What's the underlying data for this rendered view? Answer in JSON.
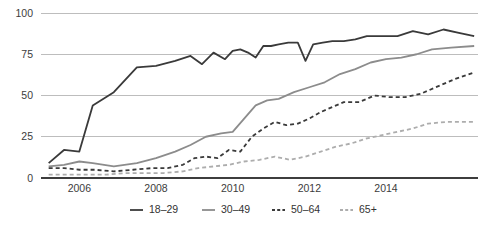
{
  "chart_data": {
    "type": "line",
    "title": "",
    "subtitle": "",
    "xlabel": "",
    "ylabel": "",
    "xlim": [
      2005.0,
      2016.4
    ],
    "ylim": [
      0,
      100
    ],
    "xticks": [
      2006,
      2008,
      2010,
      2012,
      2014
    ],
    "xtick_labels": [
      "2006",
      "2008",
      "2010",
      "2012",
      "2014"
    ],
    "yticks": [
      0,
      25,
      50,
      75,
      100
    ],
    "ytick_labels": [
      "0",
      "25",
      "50",
      "75",
      "100"
    ],
    "grid": "horizontal",
    "legend_position": "bottom",
    "series": [
      {
        "name": "18–29",
        "color": "#3a3a3a",
        "style": "solid",
        "width": 1.8,
        "x": [
          2005.2,
          2005.6,
          2006.0,
          2006.35,
          2006.9,
          2007.5,
          2008.0,
          2008.5,
          2008.9,
          2009.2,
          2009.5,
          2009.8,
          2010.0,
          2010.2,
          2010.4,
          2010.6,
          2010.8,
          2011.0,
          2011.2,
          2011.45,
          2011.7,
          2011.9,
          2012.1,
          2012.35,
          2012.6,
          2012.9,
          2013.2,
          2013.5,
          2013.9,
          2014.3,
          2014.7,
          2015.1,
          2015.5,
          2015.9,
          2016.3
        ],
        "values": [
          9,
          17,
          16,
          44,
          52,
          67,
          68,
          71,
          74,
          69,
          76,
          72,
          77,
          78,
          76,
          73,
          80,
          80,
          81,
          82,
          82,
          71,
          81,
          82,
          83,
          83,
          84,
          86,
          86,
          86,
          89,
          87,
          90,
          88,
          86
        ]
      },
      {
        "name": "30–49",
        "color": "#8c8c8c",
        "style": "solid",
        "width": 1.8,
        "x": [
          2005.2,
          2005.6,
          2006.0,
          2006.35,
          2006.9,
          2007.5,
          2008.0,
          2008.5,
          2008.9,
          2009.3,
          2009.7,
          2010.0,
          2010.3,
          2010.6,
          2010.9,
          2011.2,
          2011.6,
          2012.0,
          2012.4,
          2012.8,
          2013.2,
          2013.6,
          2014.0,
          2014.4,
          2014.8,
          2015.2,
          2015.7,
          2016.3
        ],
        "values": [
          7,
          8,
          10,
          9,
          7,
          9,
          12,
          16,
          20,
          25,
          27,
          28,
          36,
          44,
          47,
          48,
          52,
          55,
          58,
          63,
          66,
          70,
          72,
          73,
          75,
          78,
          79,
          80
        ]
      },
      {
        "name": "50–64",
        "color": "#3a3a3a",
        "style": "dashed",
        "width": 1.8,
        "dash": "4,3",
        "x": [
          2005.2,
          2005.6,
          2006.0,
          2006.4,
          2006.9,
          2007.4,
          2007.9,
          2008.3,
          2008.7,
          2009.0,
          2009.3,
          2009.6,
          2009.9,
          2010.2,
          2010.5,
          2010.8,
          2011.1,
          2011.4,
          2011.7,
          2012.0,
          2012.3,
          2012.6,
          2012.9,
          2013.3,
          2013.7,
          2014.1,
          2014.5,
          2014.9,
          2015.3,
          2015.8,
          2016.3
        ],
        "values": [
          6,
          6,
          5,
          5,
          4,
          5,
          6,
          6,
          8,
          12,
          13,
          12,
          17,
          16,
          25,
          30,
          34,
          32,
          33,
          36,
          40,
          43,
          46,
          46,
          50,
          49,
          49,
          51,
          55,
          60,
          64
        ]
      },
      {
        "name": "65+",
        "color": "#adadad",
        "style": "dashed",
        "width": 1.8,
        "dash": "4,3",
        "x": [
          2005.2,
          2005.7,
          2006.2,
          2006.7,
          2007.2,
          2007.7,
          2008.2,
          2008.7,
          2009.1,
          2009.5,
          2009.9,
          2010.3,
          2010.7,
          2011.1,
          2011.5,
          2011.9,
          2012.3,
          2012.7,
          2013.1,
          2013.5,
          2013.9,
          2014.3,
          2014.7,
          2015.1,
          2015.6,
          2016.3
        ],
        "values": [
          2,
          2,
          2,
          2,
          3,
          3,
          3,
          4,
          6,
          7,
          8,
          10,
          11,
          13,
          11,
          13,
          16,
          19,
          21,
          24,
          26,
          28,
          30,
          33,
          34,
          34
        ]
      }
    ],
    "legend": [
      {
        "label": "18–29",
        "color": "#3a3a3a",
        "style": "solid"
      },
      {
        "label": "30–49",
        "color": "#8c8c8c",
        "style": "solid"
      },
      {
        "label": "50–64",
        "color": "#3a3a3a",
        "style": "dashed"
      },
      {
        "label": "65+",
        "color": "#adadad",
        "style": "dashed"
      }
    ]
  },
  "axes": {
    "y_labels": [
      "100",
      "75",
      "50",
      "25",
      "0"
    ],
    "x_labels": [
      "2006",
      "2008",
      "2010",
      "2012",
      "2014"
    ]
  },
  "colors": {
    "background": "#ffffff",
    "grid": "#bdbdbd",
    "axis": "#3d3d3d",
    "text": "#3c3c3c",
    "series_18_29": "#3a3a3a",
    "series_30_49": "#8c8c8c",
    "series_50_64": "#3a3a3a",
    "series_65_plus": "#adadad"
  }
}
